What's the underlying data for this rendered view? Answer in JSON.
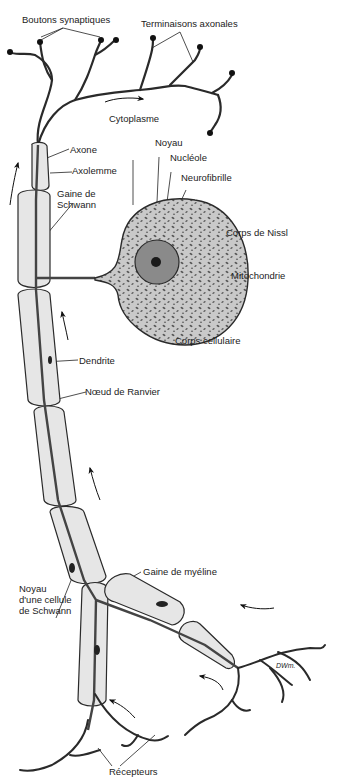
{
  "diagram": {
    "type": "neuron-anatomy",
    "colors": {
      "outline": "#2a2a2a",
      "sheath_fill": "#e6e6e6",
      "cytoplasm_fill": "#c9c9c9",
      "nissl_dots": "#555555",
      "nucleus_fill": "#8a8a8a",
      "nucleolus_fill": "#1a1a1a",
      "background": "#ffffff"
    },
    "labels": {
      "boutons_synaptiques": "Boutons synaptiques",
      "terminaisons_axonales": "Terminaisons axonales",
      "cytoplasme": "Cytoplasme",
      "noyau": "Noyau",
      "nucleole": "Nucléole",
      "neurofibrille": "Neurofibrille",
      "axone": "Axone",
      "axolemme": "Axolemme",
      "gaine_de_schwann": "Gaine de\nSchwann",
      "corps_de_nissl": "Corps de Nissl",
      "mitochondrie": "Mitochondrie",
      "corps_cellulaire": "Corps cellulaire",
      "dendrite": "Dendrite",
      "noeud_de_ranvier": "Nœud de Ranvier",
      "gaine_de_myeline": "Gaine de myéline",
      "noyau_cellule_schwann": "Noyau\nd'une cellule\nde Schwann",
      "recepteurs": "Récepteurs",
      "signature": "DWm."
    }
  }
}
